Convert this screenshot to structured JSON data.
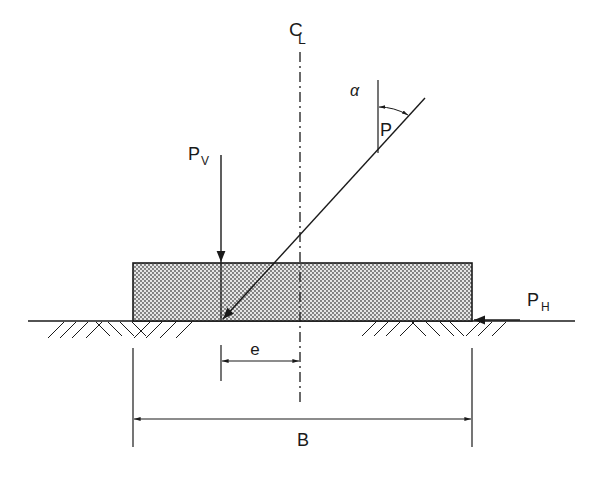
{
  "diagram": {
    "type": "footing-eccentric-inclined-load",
    "labels": {
      "centerline": "C",
      "centerline_sub": "L",
      "load_inclined": "P",
      "angle": "α",
      "load_vertical": "P",
      "load_vertical_sub": "V",
      "load_horizontal": "P",
      "load_horizontal_sub": "H",
      "eccentricity": "e",
      "width": "B"
    },
    "colors": {
      "line": "#1a1a1a",
      "fill_dots": "#555555",
      "background": "#ffffff"
    }
  }
}
